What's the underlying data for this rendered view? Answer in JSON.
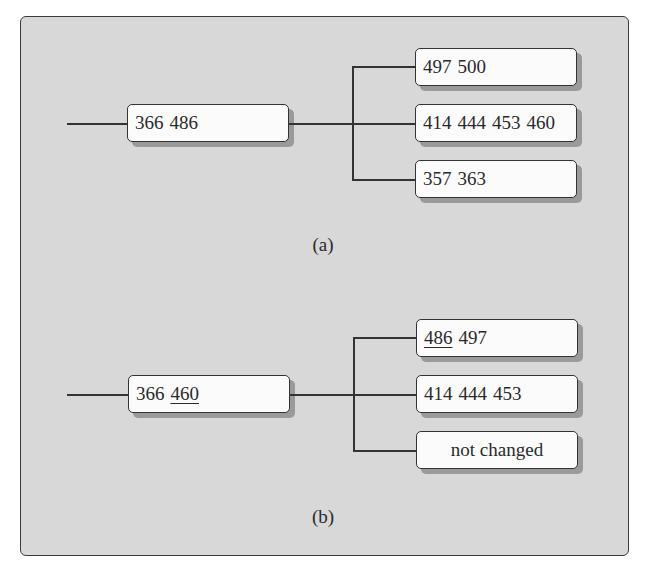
{
  "diagrams": [
    {
      "caption": "(a)",
      "root": {
        "keys": [
          {
            "text": "366",
            "underline": false
          },
          {
            "text": "486",
            "underline": false
          }
        ]
      },
      "children": [
        {
          "keys": [
            {
              "text": "497",
              "underline": false
            },
            {
              "text": "500",
              "underline": false
            }
          ]
        },
        {
          "keys": [
            {
              "text": "414",
              "underline": false
            },
            {
              "text": "444",
              "underline": false
            },
            {
              "text": "453",
              "underline": false
            },
            {
              "text": "460",
              "underline": false
            }
          ]
        },
        {
          "keys": [
            {
              "text": "357",
              "underline": false
            },
            {
              "text": "363",
              "underline": false
            }
          ]
        }
      ]
    },
    {
      "caption": "(b)",
      "root": {
        "keys": [
          {
            "text": "366",
            "underline": false
          },
          {
            "text": "460",
            "underline": true
          }
        ]
      },
      "children": [
        {
          "keys": [
            {
              "text": "486",
              "underline": true
            },
            {
              "text": "497",
              "underline": false
            }
          ]
        },
        {
          "keys": [
            {
              "text": "414",
              "underline": false
            },
            {
              "text": "444",
              "underline": false
            },
            {
              "text": "453",
              "underline": false
            }
          ]
        },
        {
          "label": "not changed"
        }
      ]
    }
  ],
  "colors": {
    "panel_background": "#d8d8d8",
    "node_background": "#fbfbfb",
    "line": "#333333",
    "shadow": "#9a9a9a"
  }
}
